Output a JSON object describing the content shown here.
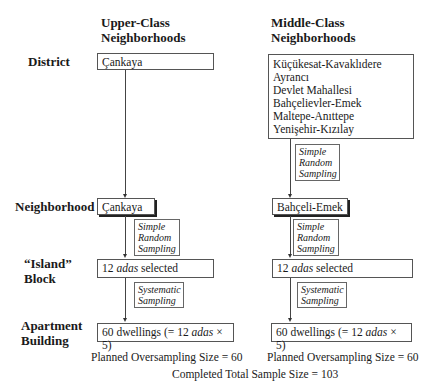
{
  "columns": {
    "upper": {
      "title_line1": "Upper-Class",
      "title_line2": "Neighborhoods"
    },
    "middle": {
      "title_line1": "Middle-Class",
      "title_line2": "Neighborhoods"
    }
  },
  "row_labels": {
    "district": "District",
    "neighborhood": "Neighborhood",
    "island_line1": "“Island”",
    "island_line2": "Block",
    "apartment_line1": "Apartment",
    "apartment_line2": "Building"
  },
  "upper": {
    "district": "Çankaya",
    "neighborhood": "Çankaya",
    "neighborhood_method": [
      "Simple",
      "Random",
      "Sampling"
    ],
    "block": {
      "count": "12",
      "unit": "adas",
      "suffix": "selected"
    },
    "block_method": [
      "Systematic",
      "Sampling"
    ],
    "building": {
      "prefix": "60 dwellings (= 12",
      "unit": "adas",
      "suffix": "× 5)"
    },
    "planned": "Planned Oversampling Size = 60"
  },
  "middle": {
    "districts": [
      "Küçükesat-Kavaklıdere",
      "Ayrancı",
      "Devlet Mahallesi",
      "Bahçelievler-Emek",
      "Maltepe-Anıttepe",
      "Yenişehir-Kızılay"
    ],
    "district_method": [
      "Simple",
      "Random",
      "Sampling"
    ],
    "neighborhood": "Bahçeli-Emek",
    "neighborhood_method": [
      "Simple",
      "Random",
      "Sampling"
    ],
    "block": {
      "count": "12",
      "unit": "adas",
      "suffix": "selected"
    },
    "block_method": [
      "Systematic",
      "Sampling"
    ],
    "building": {
      "prefix": "60 dwellings (= 12",
      "unit": "adas",
      "suffix": "× 5)"
    },
    "planned": "Planned Oversampling Size = 60"
  },
  "total": "Completed Total Sample Size = 103"
}
